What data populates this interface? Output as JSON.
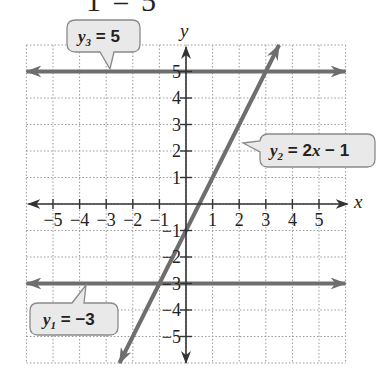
{
  "top_fragment": "1 = 5",
  "chart_data": {
    "type": "line",
    "title": "",
    "xlabel": "x",
    "ylabel": "y",
    "xlim": [
      -6,
      6
    ],
    "ylim": [
      -6,
      6
    ],
    "grid": true,
    "x_ticks": [
      -5,
      -4,
      -3,
      -2,
      -1,
      1,
      2,
      3,
      4,
      5
    ],
    "y_ticks": [
      -5,
      -4,
      -3,
      -2,
      -1,
      1,
      2,
      3,
      4,
      5
    ],
    "x_tick_labels": [
      "−5",
      "−4",
      "−3",
      "−2",
      "−1",
      "1",
      "2",
      "3",
      "4",
      "5"
    ],
    "y_tick_labels": [
      "−5",
      "−4",
      "−3",
      "−2",
      "−1",
      "1",
      "2",
      "3",
      "4",
      "5"
    ],
    "series": [
      {
        "name": "y1 = −3",
        "equation": "y = -3",
        "x": [
          -6,
          6
        ],
        "y": [
          -3,
          -3
        ]
      },
      {
        "name": "y2 = 2x − 1",
        "equation": "y = 2x - 1",
        "x": [
          -2.5,
          3.5
        ],
        "y": [
          -6,
          6
        ]
      },
      {
        "name": "y3 = 5",
        "equation": "y = 5",
        "x": [
          -6,
          6
        ],
        "y": [
          5,
          5
        ]
      }
    ],
    "annotations": [
      {
        "label_var": "y",
        "subscript": "3",
        "rest": " = 5",
        "target": "y3"
      },
      {
        "label_var": "y",
        "subscript": "2",
        "rest": " = 2x − 1",
        "target": "y2"
      },
      {
        "label_var": "y",
        "subscript": "1",
        "rest": " = −3",
        "target": "y1"
      }
    ]
  },
  "labels": {
    "x_axis": "x",
    "y_axis": "y",
    "bubble_y3": {
      "var": "y",
      "sub": "3",
      "rest": " = 5"
    },
    "bubble_y2": {
      "var": "y",
      "sub": "2",
      "eq": " = 2",
      "x": "x",
      "tail": " − 1"
    },
    "bubble_y1": {
      "var": "y",
      "sub": "1",
      "rest": " = −3"
    }
  },
  "colors": {
    "grid": "#9a9a9a",
    "axis": "#333333",
    "line": "#6e6e6e",
    "bubble_fill": "#e9e9e9",
    "bubble_stroke": "#8a8a8a"
  }
}
